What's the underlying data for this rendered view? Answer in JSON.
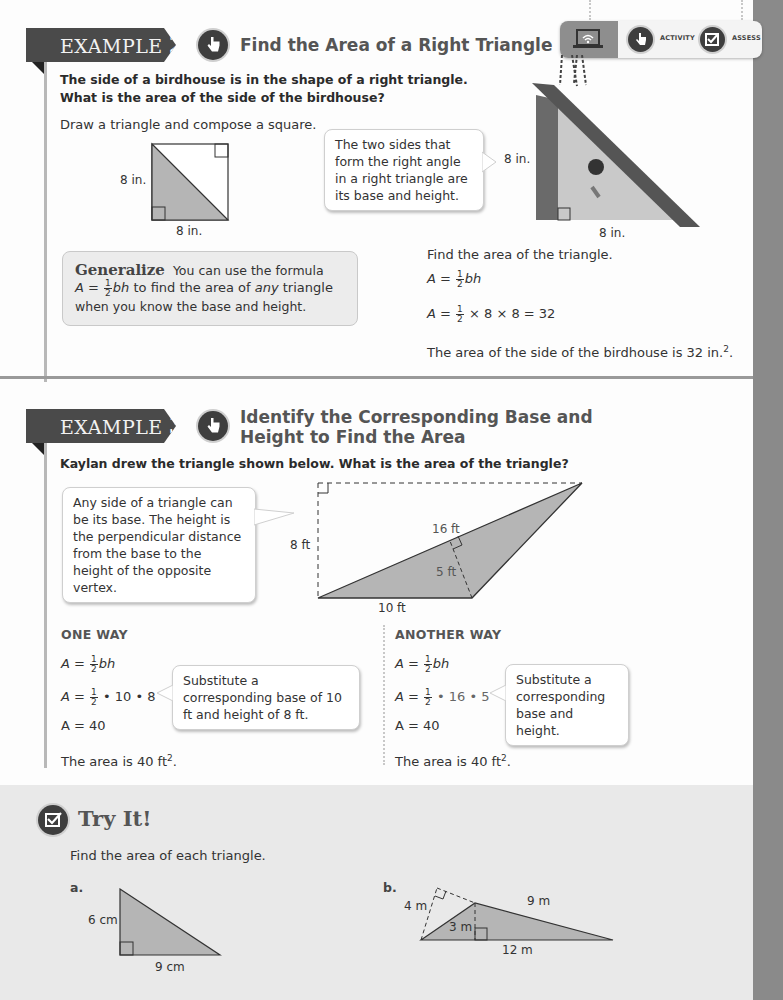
{
  "toolbar": {
    "digital_icon": "laptop-wifi-icon",
    "activity_label": "ACTIVITY",
    "assess_label": "ASSESS"
  },
  "example2": {
    "tag_word": "EXAMPLE",
    "tag_num": "2",
    "title": "Find the Area of a Right Triangle",
    "question_line1": "The side of a birdhouse is in the shape of a right triangle.",
    "question_line2": "What is the area of the side of the birdhouse?",
    "instruction": "Draw a triangle and compose a square.",
    "square_height_label": "8 in.",
    "square_base_label": "8 in.",
    "callout": "The two sides that form the right angle in a right triangle are its base and height.",
    "birdhouse_height_label": "8 in.",
    "birdhouse_base_label": "8 in.",
    "generalize_label": "Generalize",
    "generalize_text1": "You can use the formula",
    "generalize_text2_pre": "to find the area of",
    "generalize_text2_em": "any",
    "generalize_text2_post": "triangle",
    "generalize_text3": "when you know the base and height.",
    "find_text": "Find the area of the triangle.",
    "formula": "A = ½bh",
    "calc_rest": "× 8 × 8 = 32",
    "conclusion": "The area of the side of the birdhouse is 32 in.",
    "conclusion_sup": "2",
    "conclusion_end": "."
  },
  "example3": {
    "tag_word": "EXAMPLE",
    "tag_num": "3",
    "title_line1": "Identify the Corresponding Base and",
    "title_line2": "Height to Find the Area",
    "question": "Kaylan drew the triangle shown below. What is the area of the triangle?",
    "callout": "Any side of a triangle can be its base. The height is the perpendicular distance from the base to the height of the opposite vertex.",
    "labels": {
      "height": "8 ft",
      "side": "16 ft",
      "inner_height": "5 ft",
      "base": "10 ft"
    },
    "one_way": {
      "heading": "ONE WAY",
      "line2_rest": "• 10 • 8",
      "line3": "A = 40",
      "callout": "Substitute a corresponding base of 10 ft and height of 8 ft.",
      "conclusion": "The area is 40 ft",
      "sup": "2",
      "end": "."
    },
    "another_way": {
      "heading": "ANOTHER WAY",
      "line2_rest": "• 16 • 5",
      "line3": "A = 40",
      "callout": "Substitute a corresponding base and height.",
      "conclusion": "The area is 40 ft",
      "sup": "2",
      "end": "."
    }
  },
  "try_it": {
    "title": "Try It!",
    "instruction": "Find the area of each triangle.",
    "a": {
      "label": "a.",
      "height": "6 cm",
      "base": "9 cm"
    },
    "b": {
      "label": "b.",
      "slant_height": "4 m",
      "side": "9 m",
      "height": "3 m",
      "base": "12 m"
    }
  },
  "colors": {
    "tag_bg": "#4a4a4a",
    "panel_bg": "#e9e9e9",
    "shape_fill": "#b5b5b5",
    "side_strip": "#8a8a8a"
  }
}
